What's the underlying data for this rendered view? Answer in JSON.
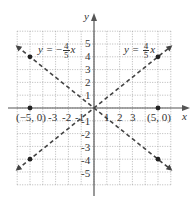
{
  "chart_data": {
    "type": "line",
    "title": "",
    "xlabel": "x",
    "ylabel": "y",
    "xlim": [
      -6,
      6
    ],
    "ylim": [
      -6,
      6
    ],
    "grid": true,
    "grid_style": "dotted",
    "x_ticks": [
      "-3",
      "-2",
      "-1",
      "1",
      "2",
      "3"
    ],
    "y_ticks": [
      "5",
      "4",
      "3",
      "2",
      "1",
      "-1",
      "-2",
      "-3",
      "-4",
      "-5"
    ],
    "series": [
      {
        "name": "y = 4/5 x",
        "equation_lhs": "y =",
        "numerator": "4",
        "denominator": "5",
        "sign": "",
        "var": "x",
        "style": "dashed",
        "x": [
          -6,
          6
        ],
        "y": [
          -4.8,
          4.8
        ],
        "marked_points": [
          [
            5,
            4
          ],
          [
            -5,
            -4
          ]
        ]
      },
      {
        "name": "y = -4/5 x",
        "equation_lhs": "y =",
        "numerator": "4",
        "denominator": "5",
        "sign": "−",
        "var": "x",
        "style": "dashed",
        "x": [
          -6,
          6
        ],
        "y": [
          4.8,
          -4.8
        ],
        "marked_points": [
          [
            -5,
            4
          ],
          [
            5,
            -4
          ]
        ]
      }
    ],
    "annotations": [
      {
        "text": "(−5, 0)",
        "x": -5,
        "y": 0
      },
      {
        "text": "(5, 0)",
        "x": 5,
        "y": 0
      }
    ],
    "colors": {
      "axis": "#555555",
      "grid": "#999999",
      "line": "#444444",
      "points": "#222222"
    }
  }
}
